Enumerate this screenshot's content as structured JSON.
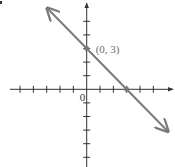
{
  "chart_data": {
    "type": "line",
    "title": "",
    "xlabel": "",
    "ylabel": "",
    "grid": false,
    "legend": null,
    "xlim": [
      -6,
      6.5
    ],
    "ylim": [
      -5.8,
      6.3
    ],
    "x_ticks": [
      -5,
      -4,
      -3,
      -2,
      -1,
      1,
      2,
      3,
      4,
      5
    ],
    "y_ticks": [
      -5,
      -4,
      -3,
      -2,
      -1,
      1,
      2,
      3,
      4,
      5
    ],
    "origin_label": "0",
    "series": [
      {
        "name": "line",
        "equation": "y = -x + 3",
        "slope": -1,
        "intercept": 3,
        "x": [
          -3,
          0,
          3,
          6
        ],
        "y": [
          6,
          3,
          0,
          -3
        ],
        "arrows_both_ends": true,
        "color": "#7a7a7a"
      }
    ],
    "points": [
      {
        "x": 0,
        "y": 3,
        "label": "(0, 3)"
      },
      {
        "x": 3,
        "y": 0,
        "label": ""
      }
    ],
    "annotations": [
      {
        "text": "(0, 3)",
        "at": [
          0,
          3
        ]
      }
    ]
  },
  "style": {
    "axis_color": "#333333",
    "line_color": "#7a7a7a",
    "point_color": "#7a7a7a"
  }
}
